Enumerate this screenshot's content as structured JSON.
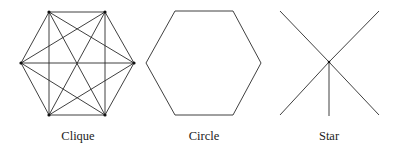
{
  "figure": {
    "panels": [
      {
        "id": "clique",
        "label": "Clique",
        "label_x": 78,
        "nodes": [
          [
            49,
            12
          ],
          [
            105,
            12
          ],
          [
            134,
            63
          ],
          [
            105,
            115
          ],
          [
            49,
            115
          ],
          [
            21,
            63
          ]
        ],
        "edges": [
          [
            0,
            1
          ],
          [
            0,
            2
          ],
          [
            0,
            3
          ],
          [
            0,
            4
          ],
          [
            0,
            5
          ],
          [
            1,
            2
          ],
          [
            1,
            3
          ],
          [
            1,
            4
          ],
          [
            1,
            5
          ],
          [
            2,
            3
          ],
          [
            2,
            4
          ],
          [
            2,
            5
          ],
          [
            3,
            4
          ],
          [
            3,
            5
          ],
          [
            4,
            5
          ]
        ],
        "show_nodes": true
      },
      {
        "id": "circle",
        "label": "Circle",
        "label_x": 204,
        "nodes": [
          [
            175,
            11
          ],
          [
            233,
            11
          ],
          [
            261,
            63
          ],
          [
            233,
            115
          ],
          [
            175,
            115
          ],
          [
            146,
            63
          ]
        ],
        "edges": [
          [
            0,
            1
          ],
          [
            1,
            2
          ],
          [
            2,
            3
          ],
          [
            3,
            4
          ],
          [
            4,
            5
          ],
          [
            5,
            0
          ]
        ],
        "show_nodes": false
      },
      {
        "id": "star",
        "label": "Star",
        "label_x": 329,
        "nodes": [
          [
            329,
            62
          ],
          [
            280,
            11
          ],
          [
            379,
            11
          ],
          [
            280,
            115
          ],
          [
            379,
            115
          ],
          [
            329,
            116
          ]
        ],
        "edges": [
          [
            0,
            1
          ],
          [
            0,
            2
          ],
          [
            0,
            3
          ],
          [
            0,
            4
          ],
          [
            0,
            5
          ]
        ],
        "show_nodes": false,
        "center_dot": true
      }
    ]
  },
  "colors": {
    "line": "#2a2a2a",
    "node": "#111111",
    "label": "#222222",
    "background": "#ffffff"
  }
}
